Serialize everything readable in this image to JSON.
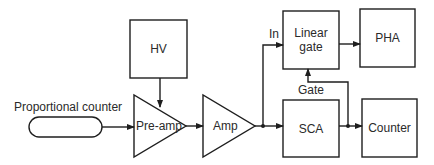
{
  "diagram": {
    "type": "block-diagram",
    "stroke_color": "#1e1e1e",
    "text_color": "#2a2a2a",
    "blocks": {
      "hv": {
        "label": "HV"
      },
      "proportional_counter": {
        "label": "Proportional counter"
      },
      "preamp": {
        "label": "Pre-amp"
      },
      "amp": {
        "label": "Amp"
      },
      "linear_gate": {
        "label_line1": "Linear",
        "label_line2": "gate"
      },
      "pha": {
        "label": "PHA"
      },
      "sca": {
        "label": "SCA"
      },
      "counter": {
        "label": "Counter"
      }
    },
    "edge_labels": {
      "in": "In",
      "gate": "Gate"
    },
    "connections": [
      {
        "from": "HV",
        "to": "Pre-amp"
      },
      {
        "from": "Proportional counter",
        "to": "Pre-amp"
      },
      {
        "from": "Pre-amp",
        "to": "Amp"
      },
      {
        "from": "Amp",
        "to": "Linear gate",
        "label": "In"
      },
      {
        "from": "Amp",
        "to": "SCA"
      },
      {
        "from": "Linear gate",
        "to": "PHA"
      },
      {
        "from": "SCA",
        "to": "Counter"
      },
      {
        "from": "SCA",
        "to": "Linear gate",
        "label": "Gate"
      }
    ]
  }
}
